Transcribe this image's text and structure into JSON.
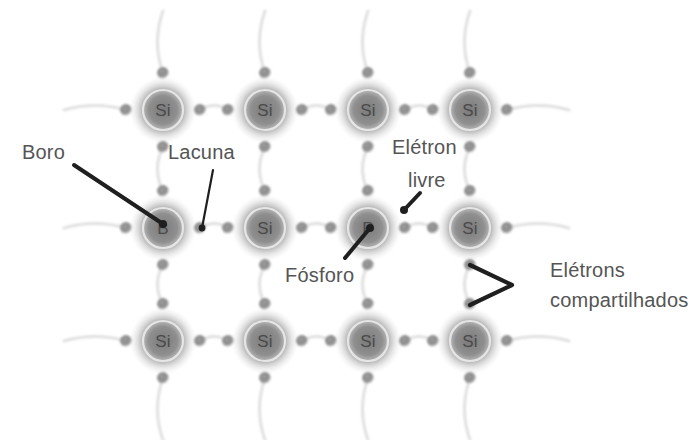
{
  "diagram": {
    "background_color": "#ffffff",
    "atom_glow_color": "#8a8a8a",
    "atom_ring_color": "#e8e8e8",
    "atom_symbol_color": "#4a4a4a",
    "electron_color": "#8c8c8c",
    "bond_color": "#d9d9d9",
    "leader_color": "#1f1f1f",
    "annotation_text_color": "#555555",
    "lattice": {
      "columns": 4,
      "rows": 3,
      "column_x": [
        163,
        265,
        368,
        470
      ],
      "row_y": [
        110,
        228,
        341
      ],
      "atom_radius": 20,
      "glow_radius": 34,
      "electron_radius": 6,
      "electron_offset": 37
    },
    "atoms": [
      {
        "id": "a-r0c0",
        "symbol": "Si",
        "row": 0,
        "col": 0,
        "cx": 163,
        "cy": 110,
        "kind": "silicon"
      },
      {
        "id": "a-r0c1",
        "symbol": "Si",
        "row": 0,
        "col": 1,
        "cx": 265,
        "cy": 110,
        "kind": "silicon"
      },
      {
        "id": "a-r0c2",
        "symbol": "Si",
        "row": 0,
        "col": 2,
        "cx": 368,
        "cy": 110,
        "kind": "silicon"
      },
      {
        "id": "a-r0c3",
        "symbol": "Si",
        "row": 0,
        "col": 3,
        "cx": 470,
        "cy": 110,
        "kind": "silicon"
      },
      {
        "id": "a-r1c0",
        "symbol": "B",
        "row": 1,
        "col": 0,
        "cx": 163,
        "cy": 228,
        "kind": "boron"
      },
      {
        "id": "a-r1c1",
        "symbol": "Si",
        "row": 1,
        "col": 1,
        "cx": 265,
        "cy": 228,
        "kind": "silicon"
      },
      {
        "id": "a-r1c2",
        "symbol": "P",
        "row": 1,
        "col": 2,
        "cx": 368,
        "cy": 228,
        "kind": "phosphorus"
      },
      {
        "id": "a-r1c3",
        "symbol": "Si",
        "row": 1,
        "col": 3,
        "cx": 470,
        "cy": 228,
        "kind": "silicon"
      },
      {
        "id": "a-r2c0",
        "symbol": "Si",
        "row": 2,
        "col": 0,
        "cx": 163,
        "cy": 341,
        "kind": "silicon"
      },
      {
        "id": "a-r2c1",
        "symbol": "Si",
        "row": 2,
        "col": 1,
        "cx": 265,
        "cy": 341,
        "kind": "silicon"
      },
      {
        "id": "a-r2c2",
        "symbol": "Si",
        "row": 2,
        "col": 2,
        "cx": 368,
        "cy": 341,
        "kind": "silicon"
      },
      {
        "id": "a-r2c3",
        "symbol": "Si",
        "row": 2,
        "col": 3,
        "cx": 470,
        "cy": 341,
        "kind": "silicon"
      }
    ],
    "annotations": [
      {
        "id": "boro",
        "label": "Boro",
        "text_x": 22,
        "text_y": 152,
        "anchor": "start",
        "target_x": 163,
        "target_y": 224,
        "leader_from_x": 74,
        "leader_from_y": 165,
        "dot": true,
        "thick": true,
        "describes": "Átomo de boro — impureza aceitadora (tipo P)"
      },
      {
        "id": "lacuna",
        "label": "Lacuna",
        "text_x": 168,
        "text_y": 152,
        "anchor": "start",
        "target_x": 202,
        "target_y": 228,
        "leader_from_x": 213,
        "leader_from_y": 170,
        "dot": true,
        "thick": false,
        "describes": "Lacuna — ausência de elétron deixada pelo boro"
      },
      {
        "id": "fosforo",
        "label": "Fósforo",
        "text_x": 285,
        "text_y": 275,
        "anchor": "start",
        "target_x": 370,
        "target_y": 228,
        "leader_from_x": 345,
        "leader_from_y": 258,
        "dot": true,
        "thick": true,
        "describes": "Átomo de fósforo — impureza doadora (tipo N)"
      },
      {
        "id": "eletron-livre",
        "label_line1": "Elétron",
        "label_line2": "livre",
        "text_x": 392,
        "text_y": 147,
        "text_x2": 408,
        "text_y2": 180,
        "anchor": "start",
        "target_x": 404,
        "target_y": 210,
        "leader_from_x": 420,
        "leader_from_y": 193,
        "dot": true,
        "thick": true,
        "describes": "Elétron livre do fósforo"
      },
      {
        "id": "eletrons-compartilhados",
        "label_line1": "Elétrons",
        "label_line2": "compartilhados",
        "text_x": 550,
        "text_y": 270,
        "text_x2": 550,
        "text_y2": 300,
        "anchor": "start",
        "bracket": {
          "top_x": 470,
          "top_y": 265,
          "mid_x": 512,
          "mid_y": 285,
          "bot_x": 470,
          "bot_y": 305
        },
        "describes": "Par de elétrons de ligação covalente compartilhada"
      }
    ]
  }
}
